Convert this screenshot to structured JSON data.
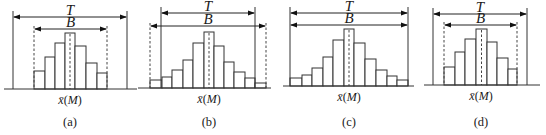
{
  "figure": {
    "panels": [
      {
        "id": "a",
        "caption": "(a)",
        "mean_label_x": "x̄",
        "mean_label_m": "M",
        "t_label": "T",
        "b_label": "B",
        "t_range": [
          13,
          127
        ],
        "b_range": [
          34,
          107
        ],
        "t_arrow_y": 17,
        "b_arrow_y": 29,
        "baseline_y": 89,
        "axis_range": [
          4,
          137
        ],
        "b_lines_dashed": true,
        "bar_edges": [
          34,
          45,
          55,
          65,
          75,
          86,
          97,
          107
        ],
        "bar_tops": [
          71,
          57,
          43,
          33,
          46,
          63,
          73
        ],
        "mean_bar_index": 3,
        "label_x": 70
      },
      {
        "id": "b",
        "caption": "(b)",
        "mean_label_x": "x̄",
        "mean_label_m": "M",
        "t_label": "T",
        "b_label": "B",
        "t_range": [
          161,
          255
        ],
        "b_range": [
          150,
          266
        ],
        "t_arrow_y": 13,
        "b_arrow_y": 26,
        "baseline_y": 88,
        "axis_range": [
          138,
          271
        ],
        "b_lines_dashed": true,
        "bar_edges": [
          150,
          162,
          172,
          183,
          193,
          204,
          214,
          224,
          234,
          245,
          255,
          266
        ],
        "bar_tops": [
          80,
          77,
          70,
          60,
          43,
          32,
          46,
          62,
          72,
          78,
          83
        ],
        "mean_bar_index": 5,
        "label_x": 209
      },
      {
        "id": "c",
        "caption": "(c)",
        "mean_label_x": "x̄",
        "mean_label_m": "M",
        "t_label": "T",
        "b_label": "B",
        "t_range": [
          290,
          408
        ],
        "b_range": [
          290,
          408
        ],
        "t_arrow_y": 13,
        "b_arrow_y": 25,
        "baseline_y": 86,
        "axis_range": [
          283,
          414
        ],
        "b_lines_dashed": false,
        "bar_edges": [
          290,
          302,
          312,
          323,
          333,
          344,
          354,
          365,
          376,
          387,
          397,
          408
        ],
        "bar_tops": [
          78,
          75,
          68,
          57,
          40,
          29,
          43,
          59,
          70,
          76,
          80
        ],
        "mean_bar_index": 5,
        "label_x": 349
      },
      {
        "id": "d",
        "caption": "(d)",
        "mean_label_x": "x̄",
        "mean_label_m": "M",
        "t_label": "T",
        "b_label": "B",
        "t_range": [
          433,
          527
        ],
        "b_range": [
          444,
          517
        ],
        "t_arrow_y": 14,
        "b_arrow_y": 25,
        "baseline_y": 85,
        "axis_range": [
          424,
          540
        ],
        "b_lines_dashed": true,
        "bar_edges": [
          444,
          455,
          465,
          476,
          487,
          497,
          508,
          517
        ],
        "bar_tops": [
          67,
          52,
          39,
          29,
          42,
          58,
          69
        ],
        "mean_bar_index": 3,
        "label_x": 481
      }
    ]
  }
}
